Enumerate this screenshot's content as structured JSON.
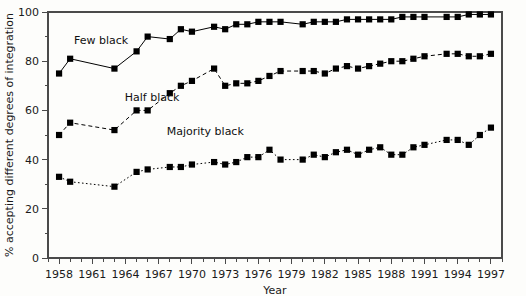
{
  "chart_data": {
    "type": "line",
    "title": "",
    "xlabel": "Year",
    "ylabel": "% accepting different degrees of integration",
    "xlim": [
      1957,
      1998
    ],
    "ylim": [
      0,
      100
    ],
    "grid": false,
    "legend_position": "inline-annotations",
    "x_major_ticks": [
      1958,
      1961,
      1964,
      1967,
      1970,
      1973,
      1976,
      1979,
      1982,
      1985,
      1988,
      1991,
      1994,
      1997
    ],
    "x_major_tick_labels": [
      "1958",
      "1961",
      "1964",
      "1967",
      "1970",
      "1973",
      "1976",
      "1979",
      "1982",
      "1985",
      "1988",
      "1991",
      "1994",
      "1997"
    ],
    "x_minor_tick_step": 1,
    "y_major_ticks": [
      0,
      20,
      40,
      60,
      80,
      100
    ],
    "y_major_tick_labels": [
      "0",
      "20",
      "40",
      "60",
      "80",
      "100"
    ],
    "y_minor_ticks": [
      10,
      30,
      50,
      70,
      90
    ],
    "x": [
      1958,
      1959,
      1963,
      1965,
      1966,
      1968,
      1969,
      1970,
      1972,
      1973,
      1974,
      1975,
      1976,
      1977,
      1978,
      1980,
      1981,
      1982,
      1983,
      1984,
      1985,
      1986,
      1987,
      1988,
      1989,
      1990,
      1991,
      1993,
      1994,
      1995,
      1996,
      1997
    ],
    "series": [
      {
        "name": "Few black",
        "label": "Few black",
        "linestyle": "solid",
        "marker": "square",
        "color": "#000000",
        "values": [
          75,
          81,
          77,
          84,
          90,
          89,
          93,
          92,
          94,
          93,
          95,
          95,
          96,
          96,
          96,
          95,
          96,
          96,
          96,
          97,
          97,
          97,
          97,
          97,
          98,
          98,
          98,
          98,
          98,
          99,
          99,
          99
        ]
      },
      {
        "name": "Half black",
        "label": "Half black",
        "linestyle": "dashed",
        "marker": "square",
        "color": "#000000",
        "values": [
          50,
          55,
          52,
          60,
          60,
          67,
          70,
          72,
          77,
          70,
          71,
          71,
          72,
          74,
          76,
          76,
          76,
          75,
          77,
          78,
          77,
          78,
          79,
          80,
          80,
          81,
          82,
          83,
          83,
          82,
          82,
          83
        ]
      },
      {
        "name": "Majority black",
        "label": "Majority black",
        "linestyle": "dotted",
        "marker": "square",
        "color": "#000000",
        "values": [
          33,
          31,
          29,
          35,
          36,
          37,
          37,
          38,
          39,
          38,
          39,
          41,
          41,
          44,
          40,
          40,
          42,
          41,
          43,
          44,
          42,
          44,
          45,
          42,
          42,
          45,
          46,
          48,
          48,
          46,
          50,
          53
        ]
      }
    ],
    "annotations": [
      {
        "text": "Few black",
        "x": 1961.8,
        "y": 87
      },
      {
        "text": "Half black",
        "x": 1966.4,
        "y": 64
      },
      {
        "text": "Majority black",
        "x": 1971.2,
        "y": 50
      }
    ]
  }
}
